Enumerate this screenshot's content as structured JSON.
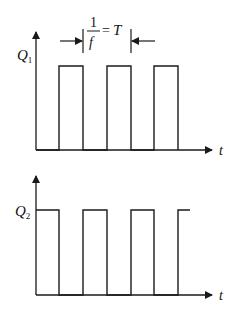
{
  "diagram": {
    "type": "timing-diagram",
    "colors": {
      "line": "#1a1a1a",
      "background": "#ffffff"
    },
    "top": {
      "signal_label": "Q",
      "signal_subscript": "1",
      "time_label": "t",
      "annotation": {
        "numerator": "1",
        "denominator": "f",
        "equals": "=",
        "rhs": "T"
      },
      "pulses": [
        [
          59,
          83
        ],
        [
          107,
          131
        ],
        [
          154,
          178
        ]
      ]
    },
    "bottom": {
      "signal_label": "Q",
      "signal_subscript": "2",
      "time_label": "t",
      "pulses": [
        [
          36,
          59
        ],
        [
          83,
          107
        ],
        [
          131,
          154
        ],
        [
          178,
          190
        ]
      ]
    }
  }
}
